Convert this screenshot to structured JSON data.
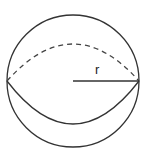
{
  "diagram": {
    "radius_label": "r",
    "stroke_color": "#333333"
  }
}
